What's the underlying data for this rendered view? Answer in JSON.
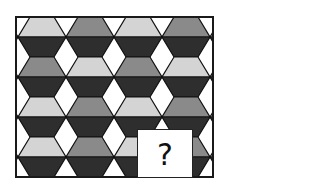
{
  "puzzle": {
    "frame": {
      "x": 16,
      "y": 17,
      "w": 197,
      "h": 160,
      "stroke": "#1a1a1a"
    },
    "grid": {
      "rows": 4,
      "cols": 5,
      "col_pitch": 48,
      "first_center_x": 42,
      "row_height": 40,
      "half_top_width": 12,
      "half_mid_width": 24
    },
    "colors": {
      "light": "#d4d4d4",
      "medium": "#8a8a8a",
      "dark": "#2e2e2e",
      "gap": "#ffffff",
      "line": "#111111"
    },
    "top_shades": [
      [
        "light",
        "medium",
        "light",
        "medium",
        "light"
      ],
      [
        "medium",
        "light",
        "medium",
        "light",
        "medium"
      ],
      [
        "light",
        "medium",
        "light",
        "medium",
        "light"
      ],
      [
        "light",
        "medium",
        "light",
        "medium",
        "light"
      ]
    ],
    "bottom_shade": "dark",
    "missing_piece": {
      "x": 137,
      "y": 129,
      "w": 56,
      "h": 49,
      "label": "?"
    }
  }
}
